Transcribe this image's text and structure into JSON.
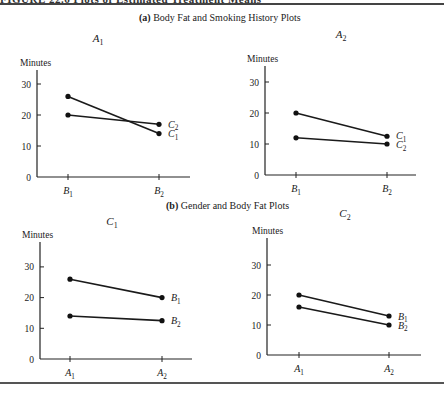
{
  "header": {
    "caption_cut": "FIGURE 22.6  Plots of Estimated Treatment Means",
    "section_a_label": "(a)",
    "section_a_title": "Body Fat and Smoking History Plots",
    "section_b_label": "(b)",
    "section_b_title": "Gender and Body Fat Plots"
  },
  "chart_data": [
    {
      "type": "line",
      "title": "A1",
      "ylabel": "Minutes",
      "xlabel": "",
      "categories": [
        "B1",
        "B2"
      ],
      "series": [
        {
          "name": "C1",
          "values": [
            26,
            14
          ]
        },
        {
          "name": "C2",
          "values": [
            20,
            17
          ]
        }
      ],
      "yticks": [
        0,
        10,
        20,
        30
      ],
      "ylim": [
        0,
        37
      ],
      "grid": false,
      "legend_position": "end-of-line labels"
    },
    {
      "type": "line",
      "title": "A2",
      "ylabel": "Minutes",
      "xlabel": "",
      "categories": [
        "B1",
        "B2"
      ],
      "series": [
        {
          "name": "C1",
          "values": [
            20,
            12.5
          ]
        },
        {
          "name": "C2",
          "values": [
            12,
            10
          ]
        }
      ],
      "yticks": [
        0,
        10,
        20,
        30
      ],
      "ylim": [
        0,
        37
      ],
      "grid": false,
      "legend_position": "end-of-line labels"
    },
    {
      "type": "line",
      "title": "C1",
      "ylabel": "Minutes",
      "xlabel": "",
      "categories": [
        "A1",
        "A2"
      ],
      "series": [
        {
          "name": "B1",
          "values": [
            26,
            20
          ]
        },
        {
          "name": "B2",
          "values": [
            14,
            12.5
          ]
        }
      ],
      "yticks": [
        0,
        10,
        20,
        30
      ],
      "ylim": [
        0,
        37
      ],
      "grid": false,
      "legend_position": "end-of-line labels"
    },
    {
      "type": "line",
      "title": "C2",
      "ylabel": "Minutes",
      "xlabel": "",
      "categories": [
        "A1",
        "A2"
      ],
      "series": [
        {
          "name": "B1",
          "values": [
            20,
            13
          ]
        },
        {
          "name": "B2",
          "values": [
            16,
            10
          ]
        }
      ],
      "yticks": [
        0,
        10,
        20,
        30
      ],
      "ylim": [
        0,
        37
      ],
      "grid": false,
      "legend_position": "end-of-line labels"
    }
  ],
  "layout": {
    "panels": [
      {
        "axis_x": 37,
        "baseline_y": 177,
        "unit_px": 3.1,
        "top_y": 70,
        "x1": 68,
        "x2": 159,
        "x_end": 190,
        "title_x": 98,
        "title_y": 42,
        "ylabel_x": 20,
        "ylabel_y": 66
      },
      {
        "axis_x": 265,
        "baseline_y": 175,
        "unit_px": 3.1,
        "top_y": 66,
        "x1": 296,
        "x2": 387,
        "x_end": 416,
        "title_x": 341,
        "title_y": 38,
        "ylabel_x": 247,
        "ylabel_y": 62
      },
      {
        "axis_x": 40,
        "baseline_y": 359,
        "unit_px": 3.07,
        "top_y": 242,
        "x1": 70,
        "x2": 162,
        "x_end": 192,
        "title_x": 112,
        "title_y": 225,
        "ylabel_x": 22,
        "ylabel_y": 238
      },
      {
        "axis_x": 267,
        "baseline_y": 355,
        "unit_px": 3.0,
        "top_y": 238,
        "x1": 299,
        "x2": 389,
        "x_end": 421,
        "title_x": 345,
        "title_y": 217,
        "ylabel_x": 252,
        "ylabel_y": 234
      }
    ]
  }
}
